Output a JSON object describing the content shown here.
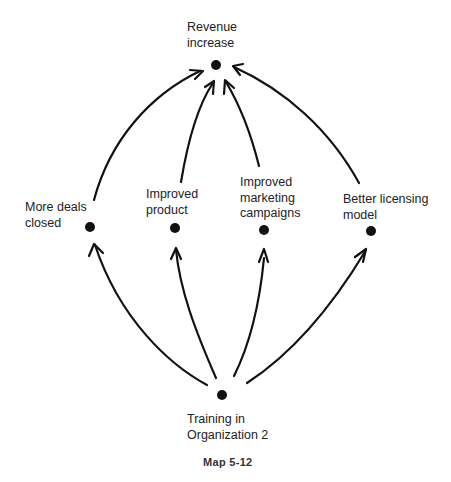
{
  "diagram": {
    "caption": "Map 5-12",
    "nodes": [
      {
        "id": "revenue",
        "label": "Revenue\nincrease",
        "x": 216,
        "y": 65
      },
      {
        "id": "deals",
        "label": "More deals\nclosed",
        "x": 90,
        "y": 227
      },
      {
        "id": "product",
        "label": "Improved\nproduct",
        "x": 175,
        "y": 228
      },
      {
        "id": "marketing",
        "label": "Improved\nmarketing\ncampaigns",
        "x": 264,
        "y": 230
      },
      {
        "id": "licensing",
        "label": "Better licensing\nmodel",
        "x": 371,
        "y": 231
      },
      {
        "id": "training",
        "label": "Training in\nOrganization 2",
        "x": 222,
        "y": 395
      }
    ],
    "edges": [
      {
        "from": "training",
        "to": "deals"
      },
      {
        "from": "training",
        "to": "product"
      },
      {
        "from": "training",
        "to": "marketing"
      },
      {
        "from": "training",
        "to": "licensing"
      },
      {
        "from": "deals",
        "to": "revenue"
      },
      {
        "from": "product",
        "to": "revenue"
      },
      {
        "from": "marketing",
        "to": "revenue"
      },
      {
        "from": "licensing",
        "to": "revenue"
      }
    ],
    "colors": {
      "ink": "#111111",
      "text": "#222222",
      "background": "#ffffff"
    }
  }
}
